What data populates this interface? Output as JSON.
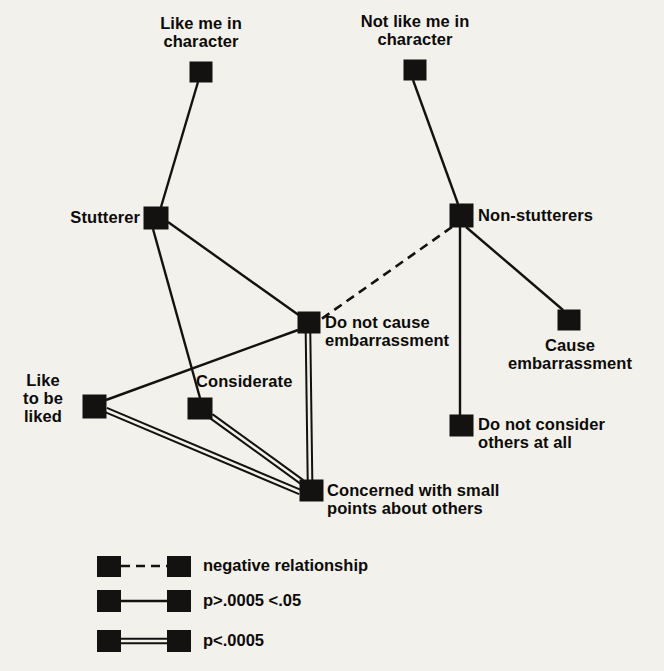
{
  "diagram": {
    "background_color": "#f3f1ec",
    "node_color": "#141210",
    "line_color": "#141210",
    "nodes": [
      {
        "id": "like_me",
        "label": "Like me in\ncharacter",
        "x": 190,
        "y": 62,
        "w": 22,
        "h": 20,
        "label_x": 130,
        "label_y": 14,
        "label_w": 142,
        "align": "center"
      },
      {
        "id": "not_like_me",
        "label": "Not like me in\ncharacter",
        "x": 404,
        "y": 60,
        "w": 22,
        "h": 20,
        "label_x": 338,
        "label_y": 12,
        "label_w": 154,
        "align": "center"
      },
      {
        "id": "stutterer",
        "label": "Stutterer",
        "x": 144,
        "y": 207,
        "w": 24,
        "h": 22,
        "label_x": 52,
        "label_y": 208,
        "label_w": 88,
        "align": "right"
      },
      {
        "id": "non_stutterers",
        "label": "Non-stutterers",
        "x": 450,
        "y": 204,
        "w": 23,
        "h": 23,
        "label_x": 478,
        "label_y": 206,
        "label_w": 140,
        "align": "left"
      },
      {
        "id": "no_embarrass",
        "label": "Do not cause\nembarrassment",
        "x": 298,
        "y": 312,
        "w": 22,
        "h": 21,
        "label_x": 325,
        "label_y": 313,
        "label_w": 170,
        "align": "left"
      },
      {
        "id": "cause_embarrass",
        "label": "Cause\nembarrassment",
        "x": 558,
        "y": 310,
        "w": 22,
        "h": 20,
        "label_x": 496,
        "label_y": 336,
        "label_w": 148,
        "align": "center"
      },
      {
        "id": "like_liked",
        "label": "Like\nto be\nliked",
        "x": 83,
        "y": 395,
        "w": 23,
        "h": 23,
        "label_x": 8,
        "label_y": 371,
        "label_w": 70,
        "align": "center"
      },
      {
        "id": "considerate",
        "label": "Considerate",
        "x": 188,
        "y": 398,
        "w": 24,
        "h": 21,
        "label_x": 196,
        "label_y": 372,
        "label_w": 130,
        "align": "left"
      },
      {
        "id": "no_consider",
        "label": "Do not consider\nothers at all",
        "x": 450,
        "y": 415,
        "w": 23,
        "h": 21,
        "label_x": 478,
        "label_y": 415,
        "label_w": 172,
        "align": "left"
      },
      {
        "id": "concerned",
        "label": "Concerned with small\npoints about others",
        "x": 300,
        "y": 480,
        "w": 23,
        "h": 21,
        "label_x": 327,
        "label_y": 481,
        "label_w": 230,
        "align": "left"
      }
    ],
    "edges": [
      {
        "from": "like_me",
        "to": "stutterer",
        "type": "single",
        "x1": 198,
        "y1": 82,
        "x2": 161,
        "y2": 207
      },
      {
        "from": "not_like_me",
        "to": "non_stutterers",
        "type": "single",
        "x1": 413,
        "y1": 80,
        "x2": 458,
        "y2": 204
      },
      {
        "from": "stutterer",
        "to": "no_embarrass",
        "type": "single",
        "x1": 168,
        "y1": 222,
        "x2": 300,
        "y2": 316
      },
      {
        "from": "stutterer",
        "to": "considerate",
        "type": "single",
        "x1": 153,
        "y1": 229,
        "x2": 200,
        "y2": 398
      },
      {
        "from": "non_stutterers",
        "to": "no_embarrass",
        "type": "negative",
        "x1": 452,
        "y1": 227,
        "x2": 320,
        "y2": 320
      },
      {
        "from": "non_stutterers",
        "to": "cause_embarrass",
        "type": "single",
        "x1": 466,
        "y1": 227,
        "x2": 563,
        "y2": 310
      },
      {
        "from": "non_stutterers",
        "to": "no_consider",
        "type": "single",
        "x1": 460,
        "y1": 227,
        "x2": 460,
        "y2": 415
      },
      {
        "from": "like_liked",
        "to": "no_embarrass",
        "type": "single",
        "x1": 106,
        "y1": 400,
        "x2": 298,
        "y2": 330
      },
      {
        "from": "no_embarrass",
        "to": "concerned",
        "type": "double",
        "x1": 308,
        "y1": 333,
        "x2": 310,
        "y2": 480
      },
      {
        "from": "like_liked",
        "to": "concerned",
        "type": "double",
        "x1": 106,
        "y1": 410,
        "x2": 300,
        "y2": 492
      },
      {
        "from": "considerate",
        "to": "concerned",
        "type": "double",
        "x1": 211,
        "y1": 416,
        "x2": 302,
        "y2": 482
      }
    ],
    "legend": {
      "items": [
        {
          "id": "negative",
          "text": "negative relationship",
          "type": "negative",
          "sq1_x": 97,
          "sq1_y": 556,
          "sq2_x": 167,
          "sq2_y": 556,
          "sq_w": 24,
          "sq_h": 21,
          "line_y": 566,
          "label_x": 203,
          "label_y": 556
        },
        {
          "id": "moderate",
          "text": "p > .0005 < .05",
          "type": "single",
          "sq1_x": 97,
          "sq1_y": 590,
          "sq2_x": 167,
          "sq2_y": 590,
          "sq_w": 24,
          "sq_h": 22,
          "line_y": 601,
          "label_x": 203,
          "label_y": 591,
          "display_text": "p>.0005 <.05"
        },
        {
          "id": "strong",
          "text": "p < .0005",
          "type": "double",
          "sq1_x": 97,
          "sq1_y": 630,
          "sq2_x": 167,
          "sq2_y": 630,
          "sq_w": 24,
          "sq_h": 22,
          "line_y": 641,
          "label_x": 203,
          "label_y": 631,
          "display_text": "p<.0005"
        }
      ]
    }
  }
}
